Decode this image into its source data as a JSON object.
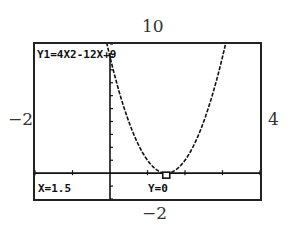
{
  "chart_data": {
    "type": "line",
    "title": "Y1=4X2-12X+9",
    "function": "4x^2-12x+9",
    "window": {
      "xmin": -2,
      "xmax": 4,
      "ymin": -2,
      "ymax": 10
    },
    "x": [
      0,
      0.5,
      1,
      1.5,
      2,
      2.5,
      3,
      3.5
    ],
    "y": [
      9,
      4,
      1,
      0,
      1,
      4,
      9,
      16
    ],
    "trace_point": {
      "x": 1.5,
      "y": 0
    },
    "xlabel": "",
    "ylabel": "",
    "ylim": [
      -2,
      10
    ],
    "xlim": [
      -2,
      4
    ],
    "grid": false
  },
  "labels": {
    "ymax": "10",
    "ymin": "−2",
    "xmin": "−2",
    "xmax": "4"
  },
  "screen": {
    "equation": "Y1=4X2-12X+9",
    "x_readout": "X=1.5",
    "y_readout": "Y=0"
  }
}
